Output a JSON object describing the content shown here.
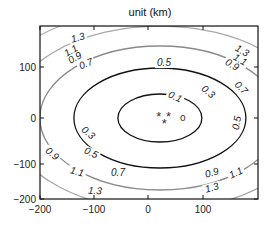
{
  "chart_data": {
    "type": "contour",
    "title": "unit (km)",
    "xlabel": "",
    "ylabel": "",
    "xlim": [
      -200,
      200
    ],
    "ylim": [
      -200,
      180
    ],
    "xticks": [
      -200,
      -100,
      0,
      100
    ],
    "yticks": [
      -200,
      -100,
      0,
      100
    ],
    "xtick_labels": [
      "−200",
      "−100",
      "0",
      "100"
    ],
    "ytick_labels": [
      "−200",
      "−100",
      "0",
      "100"
    ],
    "grid": false,
    "center": {
      "x": 20,
      "y": 0
    },
    "levels": [
      {
        "value": 0.1,
        "label": "0.1",
        "color": "#111111",
        "rx": 42,
        "ry": 24
      },
      {
        "value": 0.3,
        "label": "0.3",
        "color": "#111111",
        "rx": 86,
        "ry": 50
      },
      {
        "value": 0.5,
        "label": "0.5",
        "color": "#8a8a8a",
        "rx": 120,
        "ry": 72
      },
      {
        "value": 0.7,
        "label": "0.7",
        "color": "#a8a8a8",
        "rx": 152,
        "ry": 92
      },
      {
        "value": 0.9,
        "label": "0.9",
        "color": "#b8b8b8",
        "rx": 182,
        "ry": 110
      },
      {
        "value": 1.1,
        "label": "1.1",
        "color": "#111111",
        "rx": 212,
        "ry": 128
      },
      {
        "value": 1.3,
        "label": "1.3",
        "color": "#111111",
        "rx": 245,
        "ry": 146
      }
    ],
    "markers": [
      {
        "symbol": "*",
        "x": 18,
        "y": 5
      },
      {
        "symbol": "*",
        "x": 36,
        "y": 5
      },
      {
        "symbol": "*",
        "x": 28,
        "y": -8
      },
      {
        "symbol": "o",
        "x": 62,
        "y": 0
      }
    ],
    "contour_label_positions": [
      {
        "label": "1.3",
        "px": 78,
        "py": 40,
        "rot": -15
      },
      {
        "label": "1.1",
        "px": 71,
        "py": 53,
        "rot": -30
      },
      {
        "label": "0.9",
        "px": 75,
        "py": 60,
        "rot": -30
      },
      {
        "label": "0.7",
        "px": 86,
        "py": 66,
        "rot": -22
      },
      {
        "label": "0.5",
        "px": 164,
        "py": 65,
        "rot": 0
      },
      {
        "label": "1.3",
        "px": 242,
        "py": 53,
        "rot": 30
      },
      {
        "label": "1.1",
        "px": 240,
        "py": 62,
        "rot": 30
      },
      {
        "label": "0.9",
        "px": 232,
        "py": 67,
        "rot": 30
      },
      {
        "label": "0.7",
        "px": 241,
        "py": 90,
        "rot": 45
      },
      {
        "label": "0.3",
        "px": 208,
        "py": 94,
        "rot": 40
      },
      {
        "label": "0.1",
        "px": 175,
        "py": 99,
        "rot": 25
      },
      {
        "label": "0.5",
        "px": 237,
        "py": 125,
        "rot": -80
      },
      {
        "label": "0.3",
        "px": 88,
        "py": 135,
        "rot": 40
      },
      {
        "label": "0.5",
        "px": 91,
        "py": 155,
        "rot": 25
      },
      {
        "label": "0.9",
        "px": 52,
        "py": 156,
        "rot": 40
      },
      {
        "label": "0.7",
        "px": 118,
        "py": 175,
        "rot": 0
      },
      {
        "label": "1.1",
        "px": 77,
        "py": 174,
        "rot": 15
      },
      {
        "label": "1.3",
        "px": 95,
        "py": 193,
        "rot": 5
      },
      {
        "label": "0.9",
        "px": 212,
        "py": 175,
        "rot": -15
      },
      {
        "label": "1.1",
        "px": 236,
        "py": 175,
        "rot": -25
      },
      {
        "label": "1.3",
        "px": 212,
        "py": 190,
        "rot": -15
      }
    ]
  },
  "layout": {
    "frame": {
      "left": 40,
      "top": 26,
      "right": 258,
      "bottom": 199
    },
    "x_px": {
      "-200": 40,
      "-100": 94,
      "0": 148,
      "100": 203
    },
    "y_px": {
      "100": 67,
      "0": 118,
      "-100": 164,
      "-200": 199
    }
  }
}
